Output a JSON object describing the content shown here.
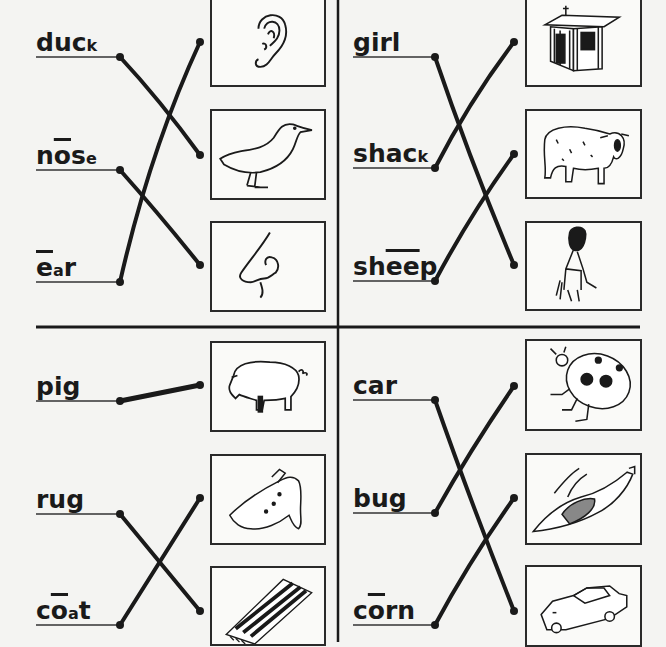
{
  "worksheet": {
    "type": "word-picture matching exercise",
    "quadrants": [
      {
        "id": "top-left",
        "words": [
          {
            "parts": [
              {
                "t": "du",
                "size": "big"
              },
              {
                "t": "c",
                "size": "big"
              },
              {
                "t": "k",
                "size": "small"
              }
            ],
            "text": "duck",
            "underline_y": 57
          },
          {
            "parts": [
              {
                "t": "n",
                "size": "big"
              },
              {
                "t": "o",
                "size": "big",
                "macron": true
              },
              {
                "t": "s",
                "size": "big"
              },
              {
                "t": "e",
                "size": "small"
              }
            ],
            "text": "nose",
            "underline_y": 170
          },
          {
            "parts": [
              {
                "t": "e",
                "size": "big",
                "macron": true
              },
              {
                "t": "a",
                "size": "small"
              },
              {
                "t": "r",
                "size": "big"
              }
            ],
            "text": "ear",
            "underline_y": 282
          }
        ],
        "pictures": [
          "ear",
          "duck",
          "nose"
        ],
        "matches": [
          [
            "duck",
            "duck"
          ],
          [
            "nose",
            "nose"
          ],
          [
            "ear",
            "ear"
          ]
        ]
      },
      {
        "id": "top-right",
        "words": [
          {
            "parts": [
              {
                "t": "girl",
                "size": "big"
              }
            ],
            "text": "girl",
            "underline_y": 57
          },
          {
            "parts": [
              {
                "t": "sha",
                "size": "big"
              },
              {
                "t": "c",
                "size": "big"
              },
              {
                "t": "k",
                "size": "small"
              }
            ],
            "text": "shack",
            "underline_y": 168
          },
          {
            "parts": [
              {
                "t": "sh",
                "size": "big"
              },
              {
                "t": "ee",
                "size": "big",
                "macron": true
              },
              {
                "t": "p",
                "size": "big"
              }
            ],
            "text": "sheep",
            "underline_y": 281
          }
        ],
        "pictures": [
          "shack",
          "sheep",
          "girl"
        ],
        "matches": [
          [
            "girl",
            "girl"
          ],
          [
            "shack",
            "shack"
          ],
          [
            "sheep",
            "sheep"
          ]
        ]
      },
      {
        "id": "bottom-left",
        "words": [
          {
            "parts": [
              {
                "t": "pig",
                "size": "big"
              }
            ],
            "text": "pig",
            "underline_y": 401
          },
          {
            "parts": [
              {
                "t": "rug",
                "size": "big"
              }
            ],
            "text": "rug",
            "underline_y": 514
          },
          {
            "parts": [
              {
                "t": "c",
                "size": "big"
              },
              {
                "t": "o",
                "size": "big",
                "macron": true
              },
              {
                "t": "a",
                "size": "small"
              },
              {
                "t": "t",
                "size": "big"
              }
            ],
            "text": "coat",
            "underline_y": 625
          }
        ],
        "pictures": [
          "pig",
          "coat",
          "rug"
        ],
        "matches": [
          [
            "pig",
            "pig"
          ],
          [
            "rug",
            "rug"
          ],
          [
            "coat",
            "coat"
          ]
        ]
      },
      {
        "id": "bottom-right",
        "words": [
          {
            "parts": [
              {
                "t": "car",
                "size": "big"
              }
            ],
            "text": "car",
            "underline_y": 400
          },
          {
            "parts": [
              {
                "t": "bug",
                "size": "big"
              }
            ],
            "text": "bug",
            "underline_y": 513
          },
          {
            "parts": [
              {
                "t": "c",
                "size": "big"
              },
              {
                "t": "o",
                "size": "big",
                "macron": true
              },
              {
                "t": "rn",
                "size": "big"
              }
            ],
            "text": "corn",
            "underline_y": 625
          }
        ],
        "pictures": [
          "bug",
          "corn",
          "car"
        ],
        "matches": [
          [
            "car",
            "car"
          ],
          [
            "bug",
            "bug"
          ],
          [
            "corn",
            "corn"
          ]
        ]
      }
    ],
    "colors": {
      "ink": "#1a1a1a",
      "paper": "#f4f4f2",
      "box_border": "#2a2a2a"
    }
  }
}
